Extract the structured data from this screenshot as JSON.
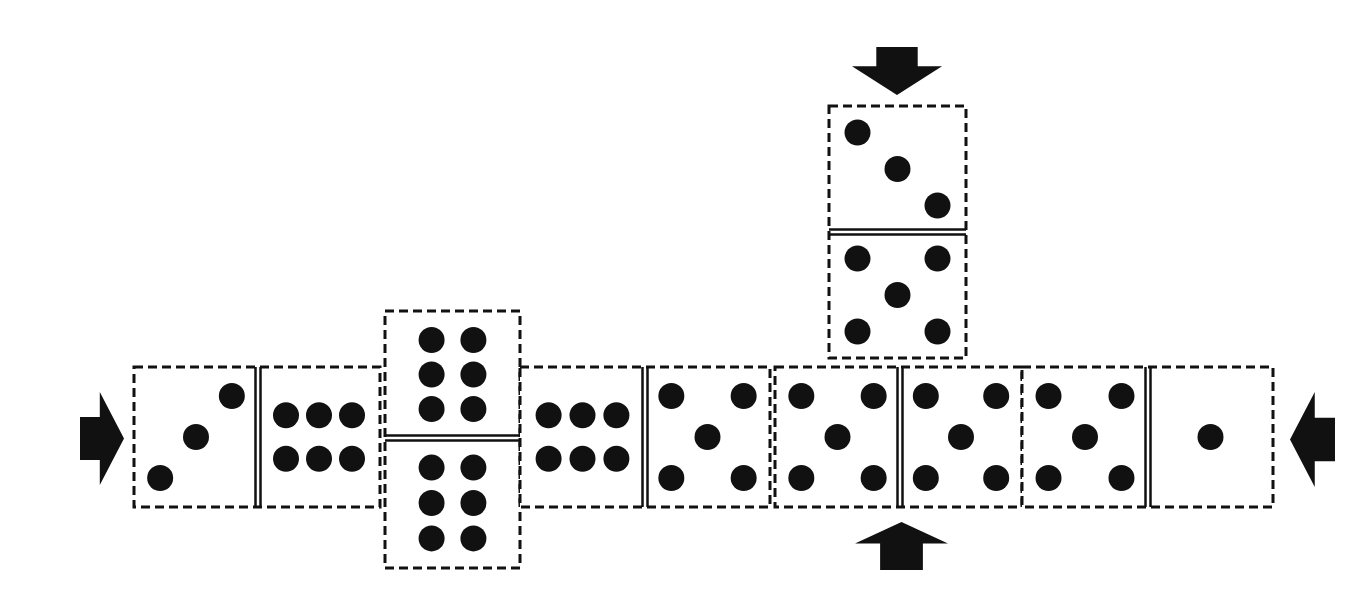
{
  "diagram": {
    "colors": {
      "ink": "#111111",
      "background": "#ffffff"
    },
    "dominoes": [
      {
        "id": "d1",
        "orientation": "horizontal",
        "x": 134,
        "y": 367,
        "w": 246,
        "h": 140,
        "divider": 258,
        "halves": [
          3,
          6
        ],
        "pip_layouts": [
          "diag-up",
          "six-rows"
        ]
      },
      {
        "id": "d2",
        "orientation": "vertical",
        "x": 385,
        "y": 311,
        "w": 135,
        "h": 257,
        "divider": 438,
        "halves": [
          6,
          6
        ],
        "pip_layouts": [
          "six-cols",
          "six-cols"
        ]
      },
      {
        "id": "d3",
        "orientation": "horizontal",
        "x": 520,
        "y": 367,
        "w": 250,
        "h": 140,
        "divider": 645,
        "halves": [
          6,
          5
        ],
        "pip_layouts": [
          "six-rows",
          "five"
        ]
      },
      {
        "id": "d4",
        "orientation": "horizontal",
        "x": 775,
        "y": 367,
        "w": 247,
        "h": 140,
        "divider": 900,
        "halves": [
          5,
          5
        ],
        "pip_layouts": [
          "five",
          "five"
        ]
      },
      {
        "id": "d5",
        "orientation": "horizontal",
        "x": 1022,
        "y": 367,
        "w": 251,
        "h": 140,
        "divider": 1148,
        "halves": [
          5,
          1
        ],
        "pip_layouts": [
          "five",
          "one"
        ]
      },
      {
        "id": "d6",
        "orientation": "vertical",
        "x": 829,
        "y": 106,
        "w": 137,
        "h": 252,
        "divider": 232,
        "halves": [
          3,
          5
        ],
        "pip_layouts": [
          "diag-down",
          "five"
        ]
      }
    ],
    "arrows": [
      {
        "id": "arrow-left",
        "direction": "right",
        "x": 80,
        "y": 392,
        "w": 44,
        "h": 93
      },
      {
        "id": "arrow-right",
        "direction": "left",
        "x": 1290,
        "y": 392,
        "w": 45,
        "h": 95
      },
      {
        "id": "arrow-top",
        "direction": "down",
        "x": 852,
        "y": 47,
        "w": 90,
        "h": 48
      },
      {
        "id": "arrow-bottom",
        "direction": "up",
        "x": 855,
        "y": 522,
        "w": 93,
        "h": 48
      }
    ]
  }
}
